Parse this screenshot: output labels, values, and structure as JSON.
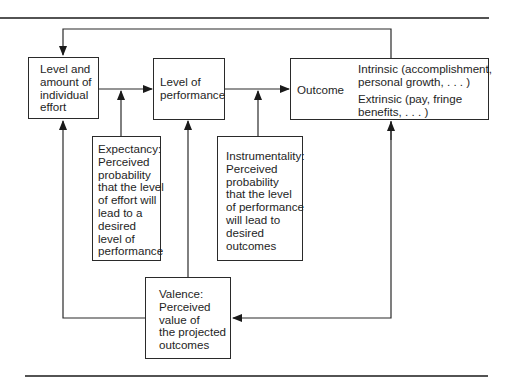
{
  "diagram": {
    "effort_box": {
      "label": "Level and\namount of\nindividual\neffort"
    },
    "performance_box": {
      "label": "Level of\nperformance"
    },
    "outcome_box": {
      "label": "Outcome",
      "intrinsic": "Intrinsic (accomplishment,\npersonal growth, . . . )",
      "extrinsic": "Extrinsic (pay, fringe\nbenefits, . . . )"
    },
    "expectancy_box": {
      "label": "Expectancy:\nPerceived\nprobability\nthat the level\nof effort will\nlead to a\ndesired\nlevel of\nperformance"
    },
    "instrumentality_box": {
      "label": "Instrumentality:\nPerceived\nprobability\nthat the level\nof performance\nwill lead to\ndesired\noutcomes"
    },
    "valence_box": {
      "label": "Valence:\nPerceived\nvalue of\nthe projected\noutcomes"
    }
  },
  "colors": {
    "line": "#2a2a2a",
    "rule": "#1a1a1a",
    "background": "#ffffff"
  }
}
